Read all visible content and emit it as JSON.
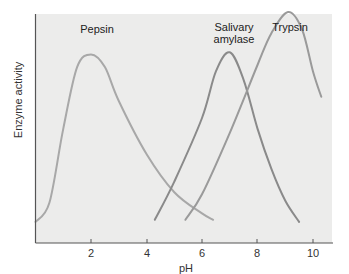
{
  "chart_data": {
    "type": "line",
    "title": "",
    "xlabel": "pH",
    "ylabel": "Enzyme activity",
    "xlim": [
      0,
      11.5
    ],
    "ylim": [
      0,
      1
    ],
    "x_ticks": [
      2,
      4,
      6,
      8,
      10
    ],
    "x_tick_labels": [
      "2",
      "4",
      "6",
      "8",
      "10"
    ],
    "y_ticks": [],
    "grid": false,
    "legend": "none (curves labeled directly above peaks)",
    "series": [
      {
        "name": "Pepsin",
        "label_lines": [
          "Pepsin"
        ],
        "color": "#a8a8a8",
        "peak_pH": 2.0,
        "peak_activity": 0.8,
        "points": [
          [
            0.0,
            0.01
          ],
          [
            0.5,
            0.1
          ],
          [
            1.0,
            0.45
          ],
          [
            1.5,
            0.74
          ],
          [
            2.0,
            0.8
          ],
          [
            2.5,
            0.74
          ],
          [
            3.0,
            0.58
          ],
          [
            4.0,
            0.33
          ],
          [
            5.0,
            0.15
          ],
          [
            6.0,
            0.05
          ],
          [
            6.4,
            0.02
          ]
        ]
      },
      {
        "name": "Salivary amylase",
        "label_lines": [
          "Salivary",
          "amylase"
        ],
        "color": "#8a8a8a",
        "peak_pH": 7.0,
        "peak_activity": 0.81,
        "points": [
          [
            4.3,
            0.02
          ],
          [
            5.0,
            0.2
          ],
          [
            6.0,
            0.5
          ],
          [
            6.5,
            0.72
          ],
          [
            7.0,
            0.81
          ],
          [
            7.5,
            0.68
          ],
          [
            8.0,
            0.45
          ],
          [
            8.5,
            0.26
          ],
          [
            9.0,
            0.11
          ],
          [
            9.5,
            0.01
          ]
        ]
      },
      {
        "name": "Trypsin",
        "label_lines": [
          "Trypsin"
        ],
        "color": "#9a9a9a",
        "peak_pH": 9.1,
        "peak_activity": 1.0,
        "points": [
          [
            5.4,
            0.02
          ],
          [
            6.0,
            0.14
          ],
          [
            7.0,
            0.43
          ],
          [
            8.0,
            0.75
          ],
          [
            8.5,
            0.9
          ],
          [
            9.1,
            1.0
          ],
          [
            9.6,
            0.92
          ],
          [
            10.0,
            0.72
          ],
          [
            10.3,
            0.6
          ]
        ]
      }
    ]
  },
  "labels": {
    "pepsin": "Pepsin",
    "amylase_line1": "Salivary",
    "amylase_line2": "amylase",
    "trypsin": "Trypsin",
    "xlabel": "pH",
    "ylabel": "Enzyme activity",
    "ticks": [
      "2",
      "4",
      "6",
      "8",
      "10"
    ]
  }
}
